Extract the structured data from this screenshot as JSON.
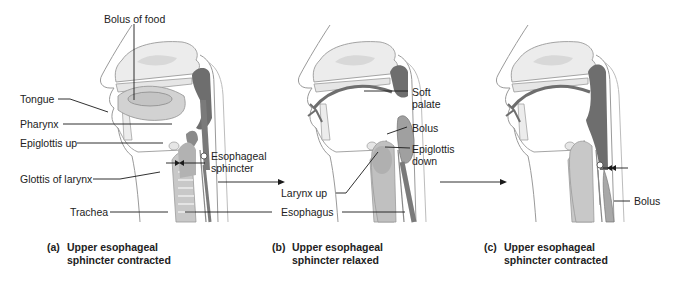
{
  "figure": {
    "colors": {
      "background": "#ffffff",
      "outline": "#9a9a9a",
      "tissue_dark": "#6e6e6e",
      "tissue_mid": "#a6a6a6",
      "tissue_light": "#dadada",
      "leader_line": "#1a1a1a",
      "text": "#222222"
    }
  },
  "panels": [
    {
      "id": "a",
      "caption_letter": "(a)",
      "caption_line1": "Upper esophageal",
      "caption_line2": "sphincter contracted",
      "labels": {
        "bolus_of_food": "Bolus of food",
        "tongue": "Tongue",
        "pharynx": "Pharynx",
        "epiglottis_up": "Epiglottis up",
        "glottis_of_larynx": "Glottis of larynx",
        "trachea": "Trachea"
      }
    },
    {
      "id": "b",
      "caption_letter": "(b)",
      "caption_line1": "Upper esophageal",
      "caption_line2": "sphincter relaxed",
      "labels": {
        "soft_palate_1": "Soft",
        "soft_palate_2": "palate",
        "bolus": "Bolus",
        "epiglottis_down_1": "Epiglottis",
        "epiglottis_down_2": "down",
        "larynx_up": "Larynx up",
        "esophagus": "Esophagus"
      }
    },
    {
      "id": "c",
      "caption_letter": "(c)",
      "caption_line1": "Upper esophageal",
      "caption_line2": "sphincter contracted",
      "labels": {
        "bolus": "Bolus"
      }
    }
  ],
  "shared_labels": {
    "esophageal_sphincter_1": "Esophageal",
    "esophageal_sphincter_2": "sphincter"
  }
}
